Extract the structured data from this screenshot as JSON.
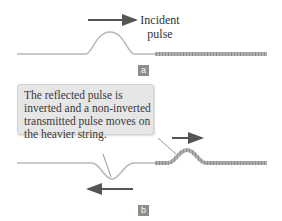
{
  "panel_a": {
    "badge": "a",
    "label_line1": "Incident",
    "label_line2": "pulse"
  },
  "panel_b": {
    "badge": "b",
    "callout_lines": [
      "The reflected pulse is",
      "inverted and a non-inverted",
      "transmitted pulse moves on",
      "the heavier string."
    ]
  },
  "colors": {
    "light_string": "#b5b5b5",
    "heavy_string": "#a9a9a9",
    "arrow": "#555555",
    "callout_bg": "#e6e6e6",
    "badge_bg": "#8c8c8c"
  }
}
